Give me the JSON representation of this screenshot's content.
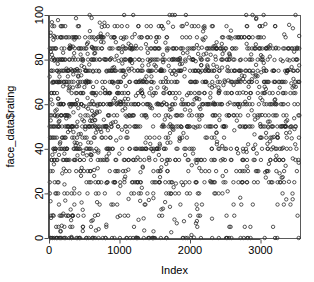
{
  "figure": {
    "kind": "r-base-scatterplot",
    "background_color": "#ffffff",
    "frame_color": "#5a5a5a",
    "point_color": "#2b2b2b",
    "point_symbol": "open-circle",
    "point_radius_px": 1.7
  },
  "chart_data": {
    "type": "scatter",
    "title": "",
    "xlabel": "Index",
    "ylabel": "face_data$rating",
    "xlim": [
      0,
      3560
    ],
    "ylim": [
      0,
      100
    ],
    "xticks": [
      0,
      1000,
      2000,
      3000
    ],
    "xtick_labels": [
      "0",
      "1000",
      "2000",
      "3000"
    ],
    "yticks": [
      0,
      20,
      40,
      60,
      80,
      100
    ],
    "ytick_labels": [
      "0",
      "20",
      "40",
      "60",
      "80",
      "100"
    ],
    "grid": false,
    "legend": null,
    "n_points": 3550,
    "series": [
      {
        "name": "face_data$rating",
        "description": "Rating value plotted against observation index; ratings cluster on multiples of 5 producing dark horizontal bands, with highest density between 35 and 90 and a dense band at 0.",
        "x_range": [
          1,
          3550
        ],
        "y_range": [
          0,
          100
        ],
        "banding_values": [
          0,
          5,
          10,
          15,
          20,
          25,
          30,
          35,
          40,
          45,
          50,
          55,
          60,
          65,
          70,
          75,
          80,
          85,
          90,
          95,
          100
        ],
        "band_weights": [
          0.6,
          0.18,
          0.22,
          0.2,
          0.3,
          0.42,
          0.3,
          0.38,
          0.62,
          0.4,
          0.78,
          0.44,
          0.8,
          0.48,
          0.74,
          0.7,
          0.78,
          0.66,
          0.42,
          0.22,
          0.3
        ],
        "density_by_index": [
          {
            "index": 0,
            "weight": 1.0
          },
          {
            "index": 500,
            "weight": 0.72
          },
          {
            "index": 1000,
            "weight": 0.62
          },
          {
            "index": 1500,
            "weight": 0.58
          },
          {
            "index": 2000,
            "weight": 0.55
          },
          {
            "index": 2500,
            "weight": 0.52
          },
          {
            "index": 3000,
            "weight": 0.5
          },
          {
            "index": 3550,
            "weight": 0.55
          }
        ],
        "low_value_sparsity_note": "points below rating 25 become sparse as index increases"
      }
    ]
  },
  "plot_box": {
    "left": 49,
    "top": 15,
    "right": 300,
    "bottom": 238
  }
}
